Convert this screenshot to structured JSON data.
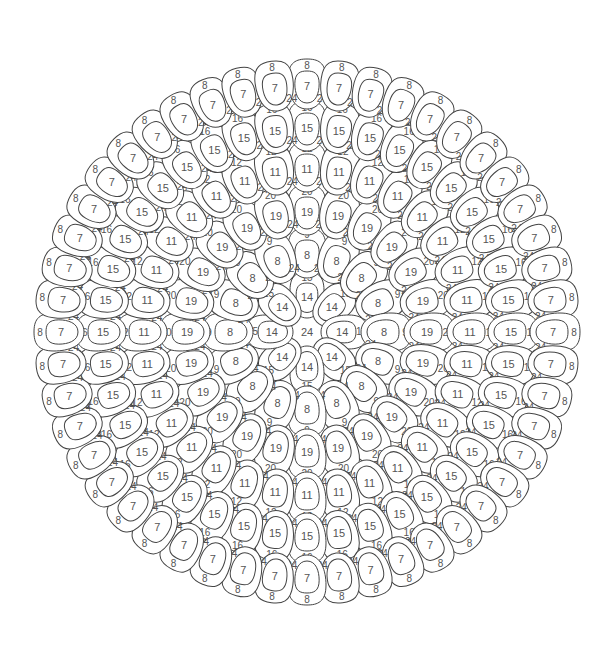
{
  "mandala": {
    "center": {
      "x": 307,
      "y": 332
    },
    "center_label": "24",
    "gap_label": "24",
    "stroke_color": "#444444",
    "text_color": "#555555",
    "rings": [
      {
        "count": 8,
        "radius": 37,
        "inner_label": "14",
        "outer_label": "15",
        "offset_deg": 0
      },
      {
        "count": 16,
        "radius": 79,
        "inner_label": "8",
        "outer_label": "9",
        "offset_deg": 0
      },
      {
        "count": 24,
        "radius": 122,
        "inner_label": "19",
        "outer_label": "20",
        "offset_deg": 0
      },
      {
        "count": 32,
        "radius": 165,
        "inner_label": "11",
        "outer_label": "12",
        "offset_deg": 0
      },
      {
        "count": 40,
        "radius": 206,
        "inner_label": "15",
        "outer_label": "16",
        "offset_deg": 0
      },
      {
        "count": 48,
        "radius": 248,
        "inner_label": "7",
        "outer_label": "8",
        "offset_deg": 0
      }
    ]
  }
}
